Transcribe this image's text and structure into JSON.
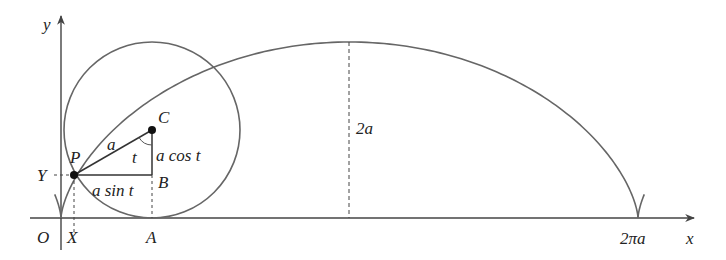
{
  "diagram": {
    "type": "cycloid-construction",
    "colors": {
      "stroke": "#555555",
      "text": "#222222",
      "background": "#ffffff"
    },
    "axes": {
      "x_label": "x",
      "y_label": "y",
      "origin_label": "O"
    },
    "points": {
      "P": "P",
      "C": "C",
      "B": "B",
      "A": "A",
      "X": "X",
      "Y": "Y"
    },
    "segment_labels": {
      "radius": "a",
      "angle": "t",
      "vertical": "a cos t",
      "horizontal": "a sin t",
      "height": "2a",
      "period": "2πa"
    }
  }
}
